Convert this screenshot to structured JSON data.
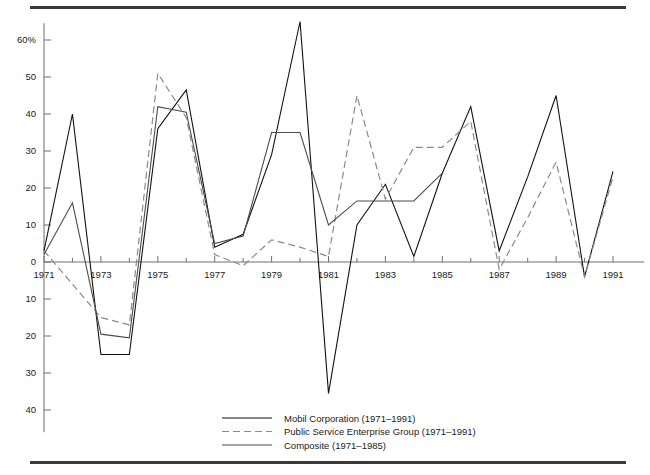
{
  "chart_data": {
    "type": "line",
    "title": "",
    "subtitle": "",
    "xlabel": "",
    "ylabel": "",
    "xlim": [
      1971,
      1991
    ],
    "ylim": [
      -45,
      65
    ],
    "grid": false,
    "legend_position": "bottom-center",
    "x": [
      1971,
      1972,
      1973,
      1974,
      1975,
      1976,
      1977,
      1978,
      1979,
      1980,
      1981,
      1982,
      1983,
      1984,
      1985,
      1986,
      1987,
      1988,
      1989,
      1990,
      1991
    ],
    "y_axis": {
      "tick_values": [
        60,
        50,
        40,
        30,
        20,
        10,
        0,
        -10,
        -20,
        -30,
        -40
      ],
      "tick_labels": [
        "60%",
        "50",
        "40",
        "30",
        "20",
        "10",
        "0",
        "10",
        "20",
        "30",
        "40"
      ],
      "note": "Negative values below zero are labelled without a minus sign"
    },
    "x_axis": {
      "tick_values": [
        1971,
        1973,
        1975,
        1977,
        1979,
        1981,
        1983,
        1985,
        1987,
        1989,
        1991
      ],
      "tick_labels": [
        "1971",
        "1973",
        "1975",
        "1977",
        "1979",
        "1981",
        "1983",
        "1985",
        "1987",
        "1989",
        "1991"
      ],
      "minor_tick_values": [
        1972,
        1974,
        1976,
        1978,
        1980,
        1982,
        1984,
        1986,
        1988,
        1990
      ]
    },
    "series": [
      {
        "name": "Mobil Corporation (1971–1991)",
        "style": "solid",
        "color": "#111111",
        "x": [
          1971,
          1972,
          1973,
          1974,
          1975,
          1976,
          1977,
          1978,
          1979,
          1980,
          1981,
          1982,
          1983,
          1984,
          1985,
          1986,
          1987,
          1988,
          1989,
          1990,
          1991
        ],
        "values": [
          3,
          40,
          -25,
          -25,
          36,
          46.5,
          4,
          7.5,
          29,
          65,
          -35.5,
          10,
          21,
          1.5,
          24,
          42,
          3,
          23,
          45,
          -4,
          24.5
        ]
      },
      {
        "name": "Public Service Enterprise Group (1971–1991)",
        "style": "dashed",
        "color": "#8a8a8a",
        "x": [
          1971,
          1972,
          1973,
          1974,
          1975,
          1976,
          1977,
          1978,
          1979,
          1980,
          1981,
          1982,
          1983,
          1984,
          1985,
          1986,
          1987,
          1988,
          1989,
          1990,
          1991
        ],
        "values": [
          3,
          -6,
          -15,
          -17,
          51,
          39,
          2,
          -1,
          6,
          4,
          1.5,
          45,
          17,
          31,
          31,
          38,
          -2,
          12,
          27,
          -4,
          23
        ]
      },
      {
        "name": "Composite (1971–1985)",
        "style": "solid",
        "color": "#4d4d4d",
        "x": [
          1971,
          1972,
          1973,
          1974,
          1975,
          1976,
          1977,
          1978,
          1979,
          1980,
          1981,
          1982,
          1983,
          1984,
          1985
        ],
        "values": [
          2,
          16,
          -19.5,
          -20.5,
          42,
          40.5,
          5,
          7,
          35,
          35,
          10,
          16.5,
          16.5,
          16.5,
          24
        ]
      }
    ],
    "legend": [
      {
        "label": "Mobil Corporation (1971–1991)",
        "style": "solid",
        "color": "#111111"
      },
      {
        "label": "Public Service Enterprise Group (1971–1991)",
        "style": "dashed",
        "color": "#8a8a8a"
      },
      {
        "label": "Composite (1971–1985)",
        "style": "solid",
        "color": "#4d4d4d"
      }
    ]
  },
  "figure": {
    "background_color": "#ffffff",
    "rule_color": "#3a3a3a",
    "axis_color": "#6e6e6e"
  }
}
